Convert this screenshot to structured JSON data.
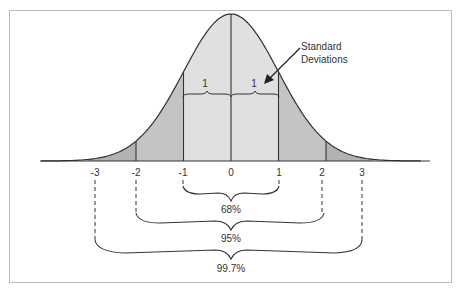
{
  "diagram": {
    "x_ticks": [
      "-3",
      "-2",
      "-1",
      "0",
      "1",
      "2",
      "3"
    ],
    "sd_labels": [
      "1",
      "1"
    ],
    "annotation": {
      "line1": "Standard",
      "line2": "Deviations"
    },
    "ranges": [
      {
        "from": "-1",
        "to": "1",
        "label": "68%"
      },
      {
        "from": "-2",
        "to": "2",
        "label": "95%"
      },
      {
        "from": "-3",
        "to": "3",
        "label": "99.7%"
      }
    ],
    "colors": {
      "inner_band": "#e0e0e0",
      "middle_band": "#c4c4c4",
      "outer_band": "#b2b2b2",
      "stroke": "#333333"
    }
  }
}
